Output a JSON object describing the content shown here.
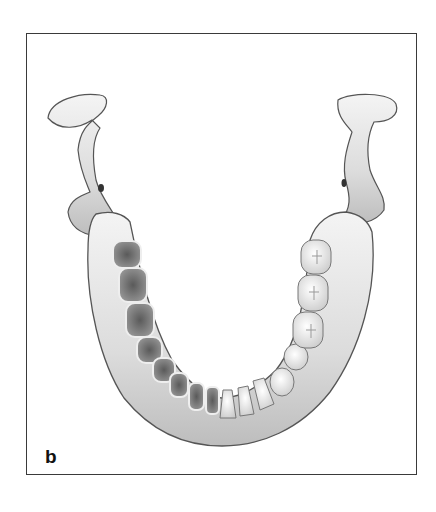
{
  "figure": {
    "panel_label": "b",
    "left_side": "empty-alveolar-sockets",
    "right_side": "teeth-in-situ",
    "colors": {
      "frame": "#3a3a3a",
      "bone_light": "#f2f2f2",
      "bone_mid": "#cfcfcf",
      "bone_dark": "#8a8a8a",
      "socket": "#6d6d6d",
      "tooth": "#fafafa"
    }
  }
}
